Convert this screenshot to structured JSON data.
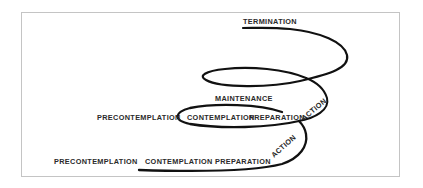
{
  "diagram": {
    "colors": {
      "line": "#111111",
      "text": "#2a2a2a",
      "border": "#c4c4c4"
    },
    "labels": {
      "termination": "TERMINATION",
      "maintenance": "MAINTENANCE",
      "middle_precontemplation": "PRECONTEMPLATION",
      "middle_contemplation": "CONTEMPLATION",
      "middle_preparation": "PREPARATION",
      "middle_action": "ACTION",
      "bottom_precontemplation": "PRECONTEMPLATION",
      "bottom_contemplation": "CONTEMPLATION",
      "bottom_preparation": "PREPARATION",
      "bottom_action": "ACTION"
    }
  }
}
